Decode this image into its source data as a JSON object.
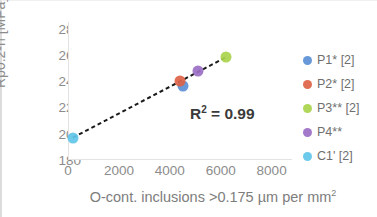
{
  "chart_data": {
    "type": "scatter",
    "title": "",
    "xlabel": "O-cont. inclusions >0.175 µm per mm²",
    "ylabel": "Rp0.2-n [MPa]",
    "xlim": [
      0,
      8800
    ],
    "ylim": [
      180,
      285
    ],
    "xticks": [
      "0",
      "2000",
      "4000",
      "6000",
      "8000"
    ],
    "xtick_values": [
      0,
      2000,
      4000,
      6000,
      8000
    ],
    "yticks": [
      "180",
      "200",
      "220",
      "240",
      "260",
      "280"
    ],
    "ytick_values": [
      180,
      200,
      220,
      240,
      260,
      280
    ],
    "grid": false,
    "legend_position": "right",
    "annotation": "R² = 0.99",
    "annotation_r_symbol": "R",
    "annotation_exponent": "2",
    "annotation_value": "= 0.99",
    "trendline": {
      "style": "dashed",
      "color": "#1a1a1a",
      "x_start": 150,
      "y_start": 197,
      "x_end": 6150,
      "y_end": 258
    },
    "points": [
      {
        "label": "P1* [2]",
        "x": 4460,
        "y": 236,
        "color": "#5b8fd4"
      },
      {
        "label": "P2* [2]",
        "x": 4380,
        "y": 240,
        "color": "#dd6347"
      },
      {
        "label": "P3** [2]",
        "x": 6150,
        "y": 258,
        "color": "#a9d44c"
      },
      {
        "label": "P4**",
        "x": 5050,
        "y": 248,
        "color": "#9b6fc4"
      },
      {
        "label": "C1' [2]",
        "x": 150,
        "y": 197,
        "color": "#62c6e8"
      }
    ],
    "series": [
      {
        "name": "P1* [2]",
        "x": [
          4460
        ],
        "values": [
          236
        ],
        "color": "#5b8fd4"
      },
      {
        "name": "P2* [2]",
        "x": [
          4380
        ],
        "values": [
          240
        ],
        "color": "#dd6347"
      },
      {
        "name": "P3** [2]",
        "x": [
          6150
        ],
        "values": [
          258
        ],
        "color": "#a9d44c"
      },
      {
        "name": "P4**",
        "x": [
          5050
        ],
        "values": [
          248
        ],
        "color": "#9b6fc4"
      },
      {
        "name": "C1' [2]",
        "x": [
          150
        ],
        "values": [
          197
        ],
        "color": "#62c6e8"
      }
    ]
  },
  "legend": {
    "items": [
      {
        "label": "P1* [2]",
        "color": "#5b8fd4"
      },
      {
        "label": "P2* [2]",
        "color": "#dd6347"
      },
      {
        "label": "P3** [2]",
        "color": "#a9d44c"
      },
      {
        "label": "P4**",
        "color": "#9b6fc4"
      },
      {
        "label": "C1' [2]",
        "color": "#62c6e8"
      }
    ]
  },
  "axes": {
    "y_title": "Rp0.2-n [MPa]",
    "x_title_text": "O-cont. inclusions >0.175 µm per mm",
    "x_title_sup": "2"
  }
}
